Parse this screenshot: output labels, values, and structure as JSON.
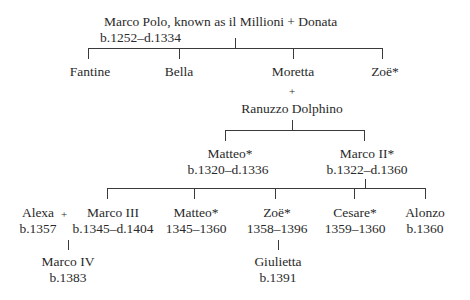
{
  "root": {
    "name": "Marco Polo, known as il Millioni + Donata",
    "dates": "b.1252–d.1334"
  },
  "children_gen1": [
    {
      "name": "Fantine"
    },
    {
      "name": "Bella"
    },
    {
      "name": "Moretta"
    },
    {
      "name": "Zoë*"
    }
  ],
  "marriage1": {
    "plus": "+",
    "spouse": "Ranuzzo Dolphino"
  },
  "children_gen2": [
    {
      "name": "Matteo*",
      "dates": "b.1320–d.1336"
    },
    {
      "name": "Marco II*",
      "dates": "b.1322–d.1360"
    }
  ],
  "children_gen3": [
    {
      "name": "Marco III",
      "dates": "b.1345–d.1404"
    },
    {
      "name": "Matteo*",
      "dates": "1345–1360"
    },
    {
      "name": "Zoë*",
      "dates": "1358–1396"
    },
    {
      "name": "Cesare*",
      "dates": "1359–1360"
    },
    {
      "name": "Alonzo",
      "dates": "b.1360"
    }
  ],
  "spouse_gen3": {
    "name": "Alexa",
    "dates": "b.1357",
    "plus": "+"
  },
  "children_gen4": [
    {
      "name": "Marco IV",
      "dates": "b.1383"
    },
    {
      "name": "Giulietta",
      "dates": "b.1391"
    }
  ]
}
